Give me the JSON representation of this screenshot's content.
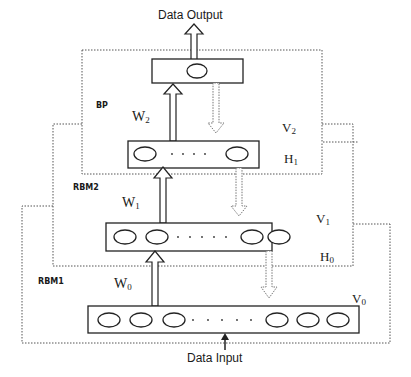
{
  "io": {
    "output": "Data Output",
    "input": "Data Input"
  },
  "regions": [
    {
      "label": "BP"
    },
    {
      "label": "RBM2"
    },
    {
      "label": "RBM1"
    }
  ],
  "weights": [
    {
      "base": "W",
      "sub": "2"
    },
    {
      "base": "W",
      "sub": "1"
    },
    {
      "base": "W",
      "sub": "0"
    }
  ],
  "layers": {
    "v2": {
      "base": "V",
      "sub": "2"
    },
    "h1": {
      "base": "H",
      "sub": "1"
    },
    "v1": {
      "base": "V",
      "sub": "1"
    },
    "h0": {
      "base": "H",
      "sub": "0"
    },
    "v0": {
      "base": "V",
      "sub": "0"
    }
  },
  "nodes": {
    "top_layer_units": 1,
    "h1_layer_units": 2,
    "v1_layer_units": 4,
    "v0_layer_units": 6
  },
  "colors": {
    "line": "#222222",
    "dotted": "#555555",
    "background": "#ffffff"
  }
}
